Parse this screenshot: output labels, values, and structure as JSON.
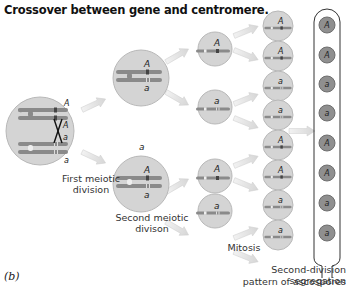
{
  "title": "Crossover between gene and centromere.",
  "panel_label": "(b)",
  "labels": {
    "first_division": "First meiotic division",
    "second_division": "Second meiotic divison",
    "mitosis": "Mitosis",
    "ascus_caption_line1": "Second-division segregation",
    "ascus_caption_line2": "pattern of ascospores"
  },
  "alleles": {
    "dominant": "A",
    "recessive": "a"
  },
  "ascospores": [
    "A",
    "A",
    "a",
    "a",
    "A",
    "A",
    "a",
    "a"
  ],
  "mitosis_cells": [
    "A",
    "A",
    "a",
    "a",
    "A",
    "A",
    "a",
    "a"
  ],
  "second_division_cells": [
    "A",
    "a",
    "A",
    "a"
  ],
  "colors": {
    "cell_fill": "#d4d4d4",
    "cell_stroke": "#b5b5b5",
    "spore_fill": "#8f8f8f",
    "chromosome": "#8a8a8a",
    "arrow": "#e2e2e2"
  }
}
